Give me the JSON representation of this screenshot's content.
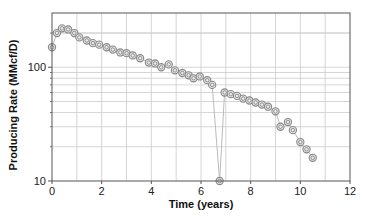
{
  "chart_data": {
    "type": "scatter",
    "title": "",
    "xlabel": "Time (years)",
    "ylabel": "Producing Rate (MMcf/D)",
    "xscale": "linear",
    "yscale": "log",
    "xlim": [
      0,
      12
    ],
    "ylim": [
      10,
      300
    ],
    "xticks": [
      0,
      2,
      4,
      6,
      8,
      10,
      12
    ],
    "yticks": [
      10,
      100
    ],
    "grid": true,
    "legend": null,
    "marker": "double-circle",
    "connect_line": true,
    "series": [
      {
        "name": "Producing Rate",
        "x": [
          0.0,
          0.2,
          0.4,
          0.65,
          0.9,
          1.1,
          1.4,
          1.65,
          1.9,
          2.2,
          2.45,
          2.75,
          3.0,
          3.25,
          3.55,
          3.9,
          4.15,
          4.4,
          4.7,
          4.95,
          5.25,
          5.5,
          5.7,
          5.95,
          6.25,
          6.45,
          6.75,
          6.95,
          7.2,
          7.45,
          7.7,
          7.95,
          8.2,
          8.45,
          8.7,
          9.0,
          9.2,
          9.5,
          9.7,
          10.0,
          10.25,
          10.5
        ],
        "y": [
          150,
          200,
          220,
          215,
          200,
          183,
          172,
          163,
          158,
          150,
          143,
          135,
          133,
          127,
          120,
          110,
          108,
          100,
          106,
          94,
          89,
          85,
          80,
          83,
          77,
          70,
          10,
          60,
          58,
          56,
          53,
          51,
          49,
          47,
          45,
          41,
          30,
          33,
          28,
          22,
          19,
          16
        ]
      }
    ],
    "colors": {
      "marker": "#888888",
      "line": "#bbbbbb",
      "grid": "#cccccc",
      "axis": "#555555"
    }
  },
  "axes": {
    "x_tick_labels": [
      "0",
      "2",
      "4",
      "6",
      "8",
      "10",
      "12"
    ],
    "y_tick_labels": [
      "10",
      "100"
    ],
    "x_title": "Time (years)",
    "y_title": "Producing Rate (MMcf/D)"
  }
}
